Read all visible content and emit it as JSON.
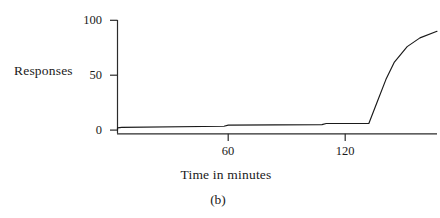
{
  "figure": {
    "caption": "(b)"
  },
  "chart_data": {
    "type": "line",
    "title": "",
    "subtitle": "",
    "xlabel": "Time in minutes",
    "ylabel": "Responses",
    "xlim": [
      0,
      150
    ],
    "ylim": [
      0,
      100
    ],
    "xticks": [
      60,
      120
    ],
    "xtick_labels": [
      "60",
      "120"
    ],
    "yticks": [
      0,
      50,
      100
    ],
    "ytick_labels": [
      "0",
      "50",
      "100"
    ],
    "grid": false,
    "legend": null,
    "annotations": [
      "(b)"
    ],
    "series": [
      {
        "name": "Cumulative responses",
        "color": "#1a1a1a",
        "x": [
          0,
          0,
          2,
          50,
          52,
          96,
          98,
          110,
          112,
          115,
          118,
          122,
          126,
          130,
          136,
          142,
          150
        ],
        "y": [
          0,
          2,
          2.5,
          3.5,
          4.5,
          5,
          6,
          6,
          6,
          6,
          6,
          26,
          46,
          62,
          76,
          84,
          90
        ]
      }
    ]
  }
}
